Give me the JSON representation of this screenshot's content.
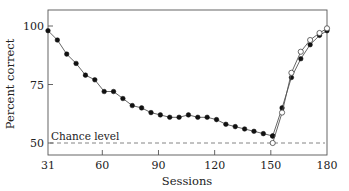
{
  "chart_data": {
    "type": "line",
    "title": "",
    "xlabel": "Sessions",
    "ylabel": "Percent correct",
    "xlim": [
      31,
      180
    ],
    "ylim": [
      45,
      106
    ],
    "xticks": [
      31,
      60,
      90,
      120,
      150,
      180
    ],
    "xtick_labels": [
      "31",
      "60",
      "90",
      "120",
      "150",
      "180"
    ],
    "yticks": [
      50,
      75,
      100
    ],
    "ytick_labels": [
      "50",
      "75",
      "100"
    ],
    "grid": false,
    "legend": null,
    "annotations": [
      {
        "text": "Chance level",
        "y": 50,
        "style": "dashed-line"
      }
    ],
    "series": [
      {
        "name": "filled",
        "marker": "filled-circle",
        "x": [
          31,
          36,
          41,
          46,
          51,
          56,
          61,
          66,
          71,
          76,
          81,
          86,
          91,
          96,
          101,
          106,
          111,
          116,
          121,
          126,
          131,
          136,
          141,
          146,
          151
        ],
        "values": [
          98,
          94,
          88,
          84,
          79,
          77,
          72,
          72,
          69,
          66,
          65,
          63,
          62,
          61,
          61,
          62,
          61,
          61,
          60,
          58,
          57,
          56,
          55,
          54,
          53
        ]
      },
      {
        "name": "filled-recovery",
        "marker": "filled-circle",
        "x": [
          151,
          156,
          161,
          166,
          171,
          176,
          180
        ],
        "values": [
          53,
          65,
          78,
          86,
          92,
          96,
          98
        ]
      },
      {
        "name": "open-recovery",
        "marker": "open-circle",
        "x": [
          151,
          156,
          161,
          166,
          171,
          176,
          180
        ],
        "values": [
          50,
          63,
          80,
          89,
          94,
          97,
          99
        ]
      }
    ]
  }
}
